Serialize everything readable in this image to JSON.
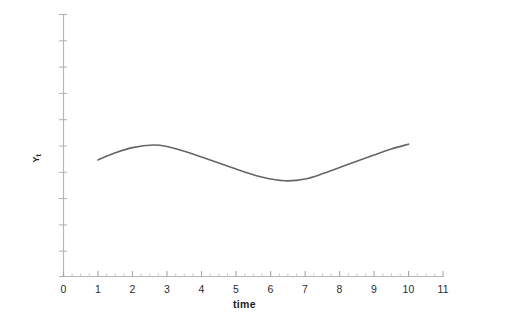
{
  "chart_data": {
    "type": "line",
    "title": "",
    "subtitle": "",
    "xlabel": "time",
    "ylabel": "Y",
    "ylabel_subscript": "t",
    "xlim": [
      0,
      11
    ],
    "ylim": [
      0,
      10
    ],
    "grid": false,
    "legend": null,
    "legend_position": "none",
    "x_tick_labels": [
      "0",
      "1",
      "2",
      "3",
      "4",
      "5",
      "6",
      "7",
      "8",
      "9",
      "10",
      "11"
    ],
    "x_tick_values": [
      0,
      1,
      2,
      3,
      4,
      5,
      6,
      7,
      8,
      9,
      10,
      11
    ],
    "x_minor_tick_interval": 0.25,
    "y_tick_labels": [],
    "y_tick_count": 11,
    "series": [
      {
        "name": "Yt",
        "color": "#666666",
        "line_width": 1.6,
        "markers": false,
        "x": [
          1.0,
          1.5,
          2.0,
          2.6,
          3.0,
          3.5,
          4.0,
          4.5,
          5.0,
          5.5,
          6.0,
          6.5,
          7.0,
          7.5,
          8.0,
          8.5,
          9.0,
          9.5,
          10.0
        ],
        "y": [
          4.45,
          4.72,
          4.92,
          5.02,
          4.96,
          4.78,
          4.56,
          4.33,
          4.1,
          3.88,
          3.72,
          3.65,
          3.72,
          3.92,
          4.16,
          4.4,
          4.64,
          4.87,
          5.05
        ]
      }
    ],
    "annotations": []
  },
  "colors": {
    "axis": "#b8b8b8",
    "tick": "#b0b0b0",
    "curve": "#666666",
    "text": "#2b2b2b",
    "title_text": "#1d1d1d",
    "background": "#ffffff"
  }
}
